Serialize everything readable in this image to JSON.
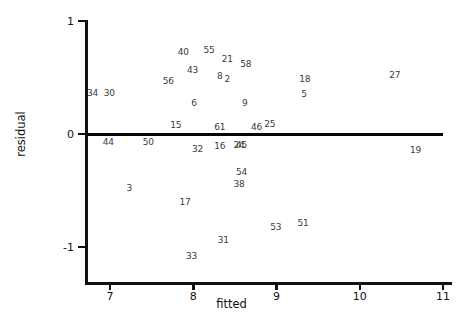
{
  "chart_data": {
    "type": "scatter",
    "title": "",
    "xlabel": "fitted",
    "ylabel": "residual",
    "xlim": [
      6.7,
      11.0
    ],
    "ylim": [
      -1.26,
      1.05
    ],
    "xticks": [
      7,
      8,
      9,
      10,
      11
    ],
    "xticklabels": [
      "7",
      "8",
      "9",
      "10",
      "11"
    ],
    "yticks": [
      1,
      0,
      -1
    ],
    "yticklabels": [
      "1",
      "0",
      "-1"
    ],
    "grid": false,
    "legend": null,
    "marker_style": "text-label",
    "annotations": [
      {
        "label": "34",
        "x": 6.79,
        "y": 0.36
      },
      {
        "label": "30",
        "x": 6.99,
        "y": 0.36
      },
      {
        "label": "56",
        "x": 7.7,
        "y": 0.47
      },
      {
        "label": "40",
        "x": 7.88,
        "y": 0.73
      },
      {
        "label": "43",
        "x": 7.99,
        "y": 0.57
      },
      {
        "label": "6",
        "x": 8.01,
        "y": 0.27
      },
      {
        "label": "15",
        "x": 7.79,
        "y": 0.08
      },
      {
        "label": "55",
        "x": 8.19,
        "y": 0.74
      },
      {
        "label": "8",
        "x": 8.32,
        "y": 0.51
      },
      {
        "label": "2",
        "x": 8.41,
        "y": 0.49
      },
      {
        "label": "21",
        "x": 8.41,
        "y": 0.66
      },
      {
        "label": "58",
        "x": 8.63,
        "y": 0.62
      },
      {
        "label": "9",
        "x": 8.62,
        "y": 0.27
      },
      {
        "label": "61",
        "x": 8.32,
        "y": 0.06
      },
      {
        "label": "46",
        "x": 8.76,
        "y": 0.06
      },
      {
        "label": "25",
        "x": 8.92,
        "y": 0.09
      },
      {
        "label": "18",
        "x": 9.34,
        "y": 0.49
      },
      {
        "label": "5",
        "x": 9.33,
        "y": 0.35
      },
      {
        "label": "27",
        "x": 10.42,
        "y": 0.52
      },
      {
        "label": "44",
        "x": 6.98,
        "y": -0.07
      },
      {
        "label": "50",
        "x": 7.46,
        "y": -0.07
      },
      {
        "label": "32",
        "x": 8.05,
        "y": -0.13
      },
      {
        "label": "16",
        "x": 8.32,
        "y": -0.11
      },
      {
        "label": "24",
        "x": 8.55,
        "y": -0.1
      },
      {
        "label": "45",
        "x": 8.58,
        "y": -0.1
      },
      {
        "label": "19",
        "x": 10.67,
        "y": -0.14
      },
      {
        "label": "54",
        "x": 8.58,
        "y": -0.34
      },
      {
        "label": "38",
        "x": 8.55,
        "y": -0.44
      },
      {
        "label": "3",
        "x": 7.23,
        "y": -0.48
      },
      {
        "label": "17",
        "x": 7.9,
        "y": -0.6
      },
      {
        "label": "53",
        "x": 8.99,
        "y": -0.82
      },
      {
        "label": "51",
        "x": 9.32,
        "y": -0.79
      },
      {
        "label": "31",
        "x": 8.36,
        "y": -0.94
      },
      {
        "label": "33",
        "x": 7.98,
        "y": -1.08
      }
    ]
  },
  "axes": {
    "x_title": "fitted",
    "y_title": "residual"
  },
  "colors": {
    "axis": "#111111",
    "reference_line": "#050505",
    "label_text": "#3b3b3b",
    "background": "#ffffff"
  }
}
